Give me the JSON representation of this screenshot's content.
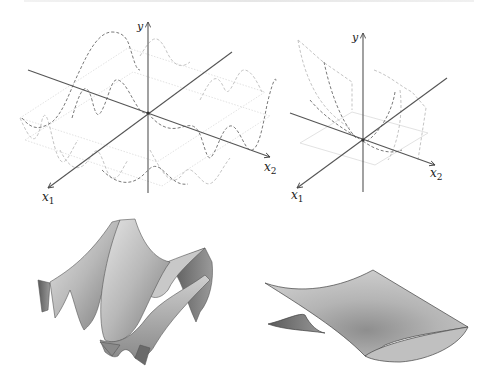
{
  "figure": {
    "panels": [
      {
        "id": "top-left",
        "type": "3d-axes-wave-curves",
        "axis_labels": {
          "y": "y",
          "x1": "x",
          "x1_sub": "1",
          "x2": "x",
          "x2_sub": "2"
        }
      },
      {
        "id": "top-right",
        "type": "3d-axes-saddle-curves",
        "axis_labels": {
          "y": "y",
          "x1": "x",
          "x1_sub": "1",
          "x2": "x",
          "x2_sub": "2"
        }
      },
      {
        "id": "bottom-left",
        "type": "shaded-surface-oscillatory"
      },
      {
        "id": "bottom-right",
        "type": "shaded-surface-saddle"
      }
    ],
    "colors": {
      "axis": "#555555",
      "curve_dark": "#6a6a6a",
      "curve_light": "#b8b8b8",
      "curve_faint": "#d6d6d6",
      "surface_light": "#d4d4d4",
      "surface_mid": "#a8a8a8",
      "surface_dark": "#5a5a5a"
    }
  }
}
